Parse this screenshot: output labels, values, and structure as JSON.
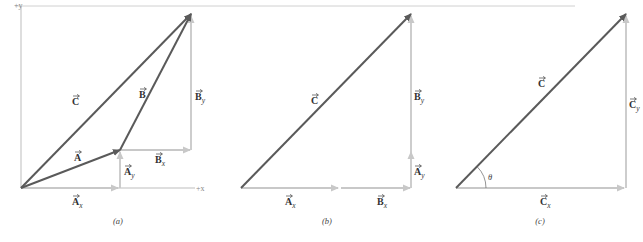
{
  "colors": {
    "resultant": "#5a5a5a",
    "component": "#c8c8c8",
    "axis": "#bdbdbd",
    "guide": "#d8d8d8"
  },
  "top_rule": {
    "x1": 15,
    "x2": 575,
    "y": 6
  },
  "panels": [
    {
      "id": "a",
      "caption": "(a)",
      "caption_pos": [
        118,
        224
      ],
      "axes": {
        "origin": [
          21,
          188
        ],
        "x_end": 195,
        "y_end": 6,
        "x_label": "+x",
        "y_label": "+y",
        "x_label_pos": [
          196,
          191
        ],
        "y_label_pos": [
          14,
          8
        ]
      },
      "vectors": [
        {
          "name": "C",
          "from": [
            21,
            188
          ],
          "to": [
            191,
            14
          ],
          "kind": "resultant",
          "label": "C",
          "sub": "",
          "lpos": [
            72,
            105
          ]
        },
        {
          "name": "A",
          "from": [
            21,
            188
          ],
          "to": [
            120,
            150
          ],
          "kind": "resultant",
          "label": "A",
          "sub": "",
          "lpos": [
            74,
            161
          ]
        },
        {
          "name": "B",
          "from": [
            120,
            150
          ],
          "to": [
            191,
            14
          ],
          "kind": "resultant",
          "label": "B",
          "sub": "",
          "lpos": [
            139,
            98
          ]
        },
        {
          "name": "Ax",
          "from": [
            21,
            188
          ],
          "to": [
            118,
            188
          ],
          "kind": "component",
          "label": "A",
          "sub": "x",
          "lpos": [
            72,
            205
          ]
        },
        {
          "name": "Ay",
          "from": [
            120,
            188
          ],
          "to": [
            120,
            152
          ],
          "kind": "component",
          "label": "A",
          "sub": "y",
          "lpos": [
            124,
            175
          ]
        },
        {
          "name": "Bx",
          "from": [
            120,
            150
          ],
          "to": [
            190,
            150
          ],
          "kind": "component",
          "label": "B",
          "sub": "x",
          "lpos": [
            155,
            163
          ]
        },
        {
          "name": "By",
          "from": [
            191,
            150
          ],
          "to": [
            191,
            16
          ],
          "kind": "component",
          "label": "B",
          "sub": "y",
          "lpos": [
            195,
            100
          ]
        }
      ]
    },
    {
      "id": "b",
      "caption": "(b)",
      "caption_pos": [
        327,
        224
      ],
      "vectors": [
        {
          "name": "C",
          "from": [
            241,
            188
          ],
          "to": [
            411,
            14
          ],
          "kind": "resultant",
          "label": "C",
          "sub": "",
          "lpos": [
            311,
            104
          ]
        },
        {
          "name": "Ax",
          "from": [
            241,
            188
          ],
          "to": [
            338,
            188
          ],
          "kind": "component",
          "label": "A",
          "sub": "x",
          "lpos": [
            285,
            205
          ]
        },
        {
          "name": "Bx",
          "from": [
            341,
            188
          ],
          "to": [
            410,
            188
          ],
          "kind": "component",
          "label": "B",
          "sub": "x",
          "lpos": [
            377,
            205
          ]
        },
        {
          "name": "Ay",
          "from": [
            411,
            188
          ],
          "to": [
            411,
            152
          ],
          "kind": "component",
          "label": "A",
          "sub": "y",
          "lpos": [
            414,
            175
          ]
        },
        {
          "name": "By",
          "from": [
            411,
            152
          ],
          "to": [
            411,
            16
          ],
          "kind": "component",
          "label": "B",
          "sub": "y",
          "lpos": [
            414,
            100
          ]
        }
      ]
    },
    {
      "id": "c",
      "caption": "(c)",
      "caption_pos": [
        540,
        224
      ],
      "vectors": [
        {
          "name": "C",
          "from": [
            456,
            188
          ],
          "to": [
            626,
            14
          ],
          "kind": "resultant",
          "label": "C",
          "sub": "",
          "lpos": [
            538,
            87
          ]
        },
        {
          "name": "Cx",
          "from": [
            456,
            188
          ],
          "to": [
            624,
            188
          ],
          "kind": "component",
          "label": "C",
          "sub": "x",
          "lpos": [
            540,
            205
          ]
        },
        {
          "name": "Cy",
          "from": [
            626,
            188
          ],
          "to": [
            626,
            16
          ],
          "kind": "component",
          "label": "C",
          "sub": "y",
          "lpos": [
            629,
            108
          ]
        }
      ],
      "angle": {
        "label": "θ",
        "center": [
          456,
          188
        ],
        "radius": 30,
        "label_pos": [
          488,
          180
        ]
      }
    }
  ]
}
